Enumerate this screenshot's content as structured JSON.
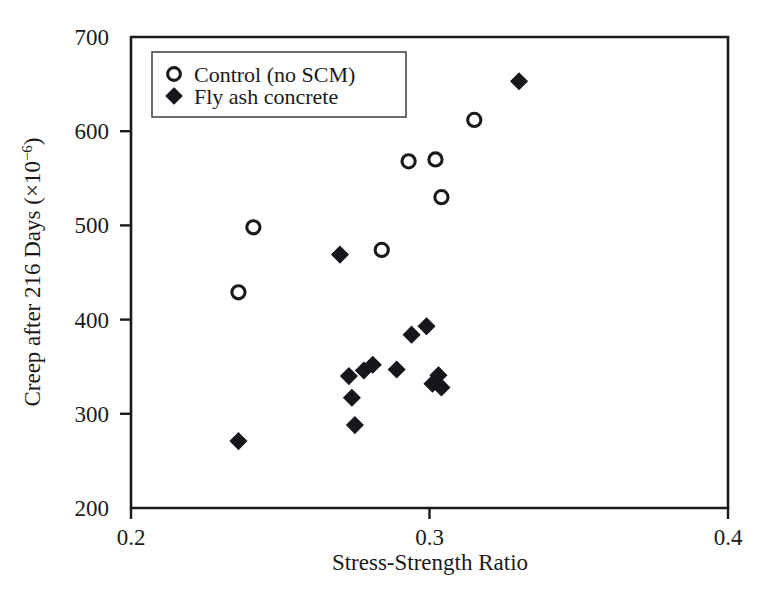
{
  "chart_data": {
    "type": "scatter",
    "title": "",
    "xlabel": "Stress-Strength Ratio",
    "ylabel_parts": {
      "main": "Creep after 216 Days (×10",
      "exponent": "−6",
      "tail": ")"
    },
    "ylabel": "Creep after 216 Days (×10⁻⁶)",
    "xlim": [
      0.2,
      0.4
    ],
    "ylim": [
      200,
      700
    ],
    "xticks": [
      0.2,
      0.3,
      0.4
    ],
    "xtick_labels": [
      "0.2",
      "0.3",
      "0.4"
    ],
    "yticks": [
      200,
      300,
      400,
      500,
      600,
      700
    ],
    "ytick_labels": [
      "200",
      "300",
      "400",
      "500",
      "600",
      "700"
    ],
    "grid": false,
    "legend_position": "top-left",
    "series": [
      {
        "name": "Control (no SCM)",
        "marker": "open-circle",
        "color": "#1a1a1a",
        "points": [
          {
            "x": 0.236,
            "y": 429
          },
          {
            "x": 0.241,
            "y": 498
          },
          {
            "x": 0.284,
            "y": 474
          },
          {
            "x": 0.293,
            "y": 568
          },
          {
            "x": 0.302,
            "y": 570
          },
          {
            "x": 0.304,
            "y": 530
          },
          {
            "x": 0.315,
            "y": 612
          }
        ]
      },
      {
        "name": "Fly ash concrete",
        "marker": "filled-diamond",
        "color": "#17171b",
        "points": [
          {
            "x": 0.236,
            "y": 271
          },
          {
            "x": 0.27,
            "y": 469
          },
          {
            "x": 0.273,
            "y": 340
          },
          {
            "x": 0.274,
            "y": 317
          },
          {
            "x": 0.275,
            "y": 288
          },
          {
            "x": 0.278,
            "y": 346
          },
          {
            "x": 0.281,
            "y": 352
          },
          {
            "x": 0.289,
            "y": 347
          },
          {
            "x": 0.294,
            "y": 384
          },
          {
            "x": 0.299,
            "y": 393
          },
          {
            "x": 0.301,
            "y": 332
          },
          {
            "x": 0.303,
            "y": 341
          },
          {
            "x": 0.304,
            "y": 328
          },
          {
            "x": 0.33,
            "y": 653
          }
        ]
      }
    ]
  },
  "legend": {
    "entries": [
      {
        "label": "Control (no SCM)",
        "marker": "open-circle"
      },
      {
        "label": "Fly ash concrete",
        "marker": "filled-diamond"
      }
    ]
  }
}
